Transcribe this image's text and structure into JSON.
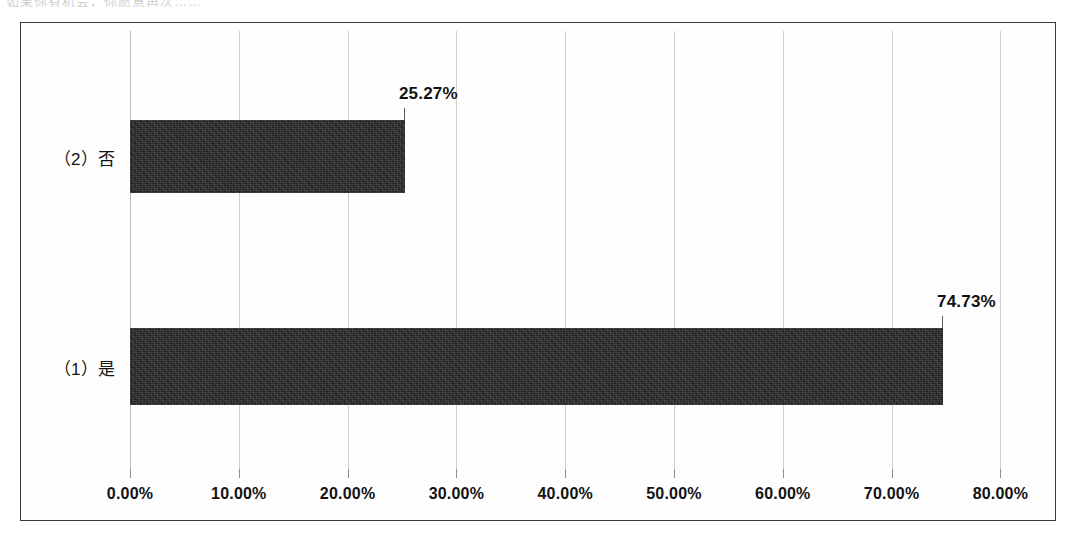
{
  "caption": {
    "clipped_text": "如果你有机会，你愿意再次……"
  },
  "chart_data": {
    "type": "bar",
    "orientation": "horizontal",
    "title": "",
    "xlabel": "",
    "ylabel": "",
    "categories": [
      "（1）是",
      "（2）否"
    ],
    "values": [
      74.73,
      25.27
    ],
    "value_labels": [
      "74.73%",
      "25.27%"
    ],
    "series": [
      {
        "name": "",
        "values": [
          74.73,
          25.27
        ]
      }
    ],
    "xlim": [
      0,
      80
    ],
    "xticks": [
      0,
      10,
      20,
      30,
      40,
      50,
      60,
      70,
      80
    ],
    "xtick_labels": [
      "0.00%",
      "10.00%",
      "20.00%",
      "30.00%",
      "40.00%",
      "50.00%",
      "60.00%",
      "70.00%",
      "80.00%"
    ],
    "grid": true,
    "grid_axis": "x",
    "legend": false,
    "bar_color": "#242424",
    "grid_color": "#cfcfcf",
    "frame_color": "#3a3a3a",
    "background": "#fefefe",
    "data_labels_shown": true
  }
}
